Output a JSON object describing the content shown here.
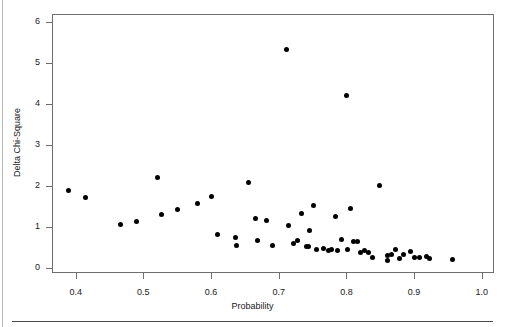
{
  "figure": {
    "title": "",
    "background_color": "#ffffff",
    "point_color": "#000000",
    "frame_color": "#6f6f6f",
    "rule_color": "#4a4a4a"
  },
  "chart_data": {
    "type": "scatter",
    "title": "",
    "xlabel": "Probability",
    "ylabel": "Delta Chi-Square",
    "xlim": [
      0.365,
      1.018
    ],
    "ylim": [
      -0.12,
      6.2
    ],
    "xticks": [
      0.4,
      0.5,
      0.6,
      0.7,
      0.8,
      0.9,
      1.0
    ],
    "xticklabels": [
      "0.4",
      "0.5",
      "0.6",
      "0.7",
      "0.8",
      "0.9",
      "1.0"
    ],
    "yticks": [
      0,
      1,
      2,
      3,
      4,
      5,
      6
    ],
    "yticklabels": [
      "0",
      "1",
      "2",
      "3",
      "4",
      "5",
      "6"
    ],
    "grid": false,
    "legend": null,
    "marker": "filled-circle",
    "marker_size_px": 5,
    "n_points": 55,
    "x": [
      0.39,
      0.414,
      0.466,
      0.49,
      0.521,
      0.527,
      0.551,
      0.58,
      0.6,
      0.61,
      0.636,
      0.638,
      0.656,
      0.666,
      0.669,
      0.682,
      0.691,
      0.712,
      0.714,
      0.722,
      0.727,
      0.733,
      0.741,
      0.744,
      0.746,
      0.751,
      0.756,
      0.766,
      0.773,
      0.778,
      0.784,
      0.787,
      0.793,
      0.8,
      0.802,
      0.806,
      0.81,
      0.816,
      0.821,
      0.827,
      0.833,
      0.839,
      0.849,
      0.861,
      0.861,
      0.866,
      0.872,
      0.878,
      0.884,
      0.894,
      0.901,
      0.908,
      0.918,
      0.922,
      0.957
    ],
    "y": [
      1.9,
      1.72,
      1.06,
      1.14,
      2.2,
      1.3,
      1.42,
      1.57,
      1.74,
      0.82,
      0.74,
      0.56,
      2.1,
      1.22,
      0.67,
      1.17,
      0.56,
      5.33,
      1.03,
      0.59,
      0.68,
      1.32,
      0.52,
      0.52,
      0.91,
      1.52,
      0.45,
      0.49,
      0.42,
      0.46,
      1.26,
      0.44,
      0.7,
      4.22,
      0.45,
      1.45,
      0.64,
      0.66,
      0.39,
      0.44,
      0.37,
      0.26,
      2.02,
      0.3,
      0.18,
      0.33,
      0.46,
      0.23,
      0.32,
      0.41,
      0.25,
      0.27,
      0.29,
      0.24,
      0.22
    ]
  }
}
